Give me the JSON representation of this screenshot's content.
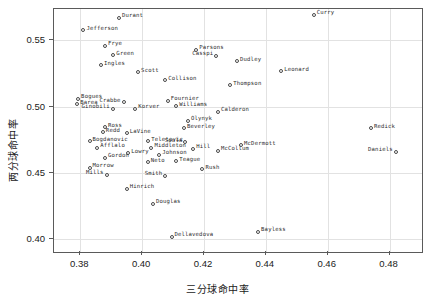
{
  "chart_data": {
    "type": "scatter",
    "title": "",
    "xlabel": "三分球命中率",
    "ylabel": "两分球命中率",
    "xlim": [
      0.3715,
      0.4905
    ],
    "ylim": [
      0.3905,
      0.5735
    ],
    "xticks": [
      "0.38",
      "0.40",
      "0.42",
      "0.44",
      "0.46",
      "0.48"
    ],
    "xtickvalues": [
      0.38,
      0.4,
      0.42,
      0.44,
      0.46,
      0.48
    ],
    "yticks": [
      "0.40",
      "0.45",
      "0.50",
      "0.55"
    ],
    "ytickvalues": [
      0.4,
      0.45,
      0.5,
      0.55
    ],
    "grid": true,
    "legend": "none",
    "marker": "open-circle",
    "points": [
      {
        "label": "Durant",
        "x": 0.3925,
        "y": 0.5668,
        "pos": "right"
      },
      {
        "label": "Jefferson",
        "x": 0.381,
        "y": 0.5575,
        "pos": "right"
      },
      {
        "label": "Frye",
        "x": 0.388,
        "y": 0.5458,
        "pos": "right"
      },
      {
        "label": "Green",
        "x": 0.3907,
        "y": 0.5388,
        "pos": "right"
      },
      {
        "label": "Ingles",
        "x": 0.3867,
        "y": 0.531,
        "pos": "right"
      },
      {
        "label": "Scott",
        "x": 0.3987,
        "y": 0.5258,
        "pos": "right"
      },
      {
        "label": "Casspi",
        "x": 0.424,
        "y": 0.5383,
        "pos": "left"
      },
      {
        "label": "Parsons",
        "x": 0.4175,
        "y": 0.5428,
        "pos": "right"
      },
      {
        "label": "Dudley",
        "x": 0.4307,
        "y": 0.534,
        "pos": "right"
      },
      {
        "label": "Curry",
        "x": 0.4555,
        "y": 0.569,
        "pos": "right"
      },
      {
        "label": "Leonard",
        "x": 0.445,
        "y": 0.5265,
        "pos": "right"
      },
      {
        "label": "Thompson",
        "x": 0.4285,
        "y": 0.516,
        "pos": "right"
      },
      {
        "label": "Collison",
        "x": 0.4075,
        "y": 0.52,
        "pos": "right"
      },
      {
        "label": "Bogues",
        "x": 0.3793,
        "y": 0.506,
        "pos": "right"
      },
      {
        "label": "Barea",
        "x": 0.379,
        "y": 0.5018,
        "pos": "right"
      },
      {
        "label": "Crabbe",
        "x": 0.394,
        "y": 0.5033,
        "pos": "left"
      },
      {
        "label": "Ginobili",
        "x": 0.3905,
        "y": 0.4985,
        "pos": "left"
      },
      {
        "label": "Korver",
        "x": 0.3978,
        "y": 0.4985,
        "pos": "right"
      },
      {
        "label": "Fournier",
        "x": 0.4083,
        "y": 0.5045,
        "pos": "right"
      },
      {
        "label": "Williams",
        "x": 0.411,
        "y": 0.5003,
        "pos": "right"
      },
      {
        "label": "Calderon",
        "x": 0.4245,
        "y": 0.4962,
        "pos": "right"
      },
      {
        "label": "Redick",
        "x": 0.474,
        "y": 0.4838,
        "pos": "right"
      },
      {
        "label": "Daniels",
        "x": 0.482,
        "y": 0.466,
        "pos": "left"
      },
      {
        "label": "Olynyk",
        "x": 0.4148,
        "y": 0.4893,
        "pos": "right"
      },
      {
        "label": "Beverley",
        "x": 0.4135,
        "y": 0.4838,
        "pos": "right"
      },
      {
        "label": "Ross",
        "x": 0.388,
        "y": 0.4845,
        "pos": "right"
      },
      {
        "label": "Redd",
        "x": 0.3873,
        "y": 0.4805,
        "pos": "right"
      },
      {
        "label": "LaVine",
        "x": 0.395,
        "y": 0.48,
        "pos": "right"
      },
      {
        "label": "Bogdanovic",
        "x": 0.383,
        "y": 0.474,
        "pos": "right"
      },
      {
        "label": "Teletovic",
        "x": 0.402,
        "y": 0.474,
        "pos": "right"
      },
      {
        "label": "Soula",
        "x": 0.414,
        "y": 0.473,
        "pos": "left"
      },
      {
        "label": "Afflalo",
        "x": 0.3855,
        "y": 0.469,
        "pos": "right"
      },
      {
        "label": "Middleton",
        "x": 0.403,
        "y": 0.469,
        "pos": "right"
      },
      {
        "label": "Hill",
        "x": 0.4165,
        "y": 0.4683,
        "pos": "right"
      },
      {
        "label": "McCollum",
        "x": 0.4245,
        "y": 0.4668,
        "pos": "right"
      },
      {
        "label": "McDermott",
        "x": 0.432,
        "y": 0.471,
        "pos": "right"
      },
      {
        "label": "Johnson",
        "x": 0.4055,
        "y": 0.4638,
        "pos": "right"
      },
      {
        "label": "Lowry",
        "x": 0.3955,
        "y": 0.4648,
        "pos": "right"
      },
      {
        "label": "Gordon",
        "x": 0.388,
        "y": 0.4613,
        "pos": "right"
      },
      {
        "label": "Neto",
        "x": 0.4018,
        "y": 0.458,
        "pos": "right"
      },
      {
        "label": "Teague",
        "x": 0.411,
        "y": 0.4588,
        "pos": "right"
      },
      {
        "label": "Rush",
        "x": 0.4195,
        "y": 0.4528,
        "pos": "right"
      },
      {
        "label": "Morrow",
        "x": 0.383,
        "y": 0.454,
        "pos": "right"
      },
      {
        "label": "Mills",
        "x": 0.3885,
        "y": 0.4485,
        "pos": "left"
      },
      {
        "label": "Smith",
        "x": 0.4075,
        "y": 0.448,
        "pos": "left"
      },
      {
        "label": "Hinrich",
        "x": 0.395,
        "y": 0.4383,
        "pos": "right"
      },
      {
        "label": "Douglas",
        "x": 0.4035,
        "y": 0.427,
        "pos": "right"
      },
      {
        "label": "Dellavedova",
        "x": 0.4095,
        "y": 0.4018,
        "pos": "right"
      },
      {
        "label": "Bayless",
        "x": 0.4375,
        "y": 0.4058,
        "pos": "right"
      }
    ]
  }
}
